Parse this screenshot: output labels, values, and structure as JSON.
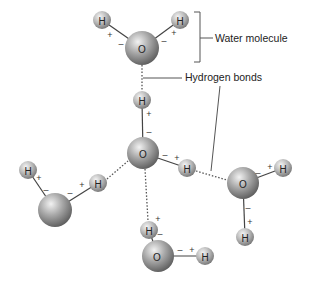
{
  "labels": {
    "water_molecule": "Water molecule",
    "hydrogen_bonds": "Hydrogen bonds"
  },
  "atoms": {
    "oxygen": "O",
    "hydrogen": "H"
  },
  "charges": {
    "positive": "+",
    "negative": "–"
  },
  "colors": {
    "atom_light": "#e8e8e8",
    "atom_dark": "#6a6a6a",
    "bond": "#444444",
    "background": "#ffffff"
  }
}
